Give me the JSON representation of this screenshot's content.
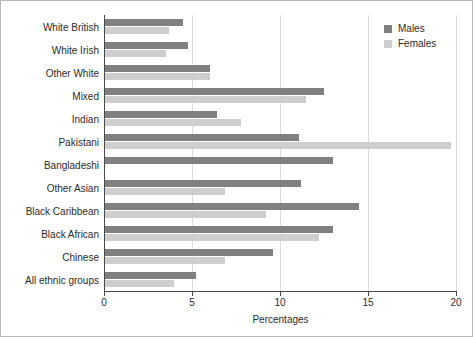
{
  "chart_data": {
    "type": "bar",
    "orientation": "horizontal",
    "title": "",
    "xlabel": "Percentages",
    "ylabel": "",
    "xlim": [
      0,
      20
    ],
    "xticks": [
      0,
      5,
      10,
      15,
      20
    ],
    "grid": "vertical",
    "legend_position": "top-right",
    "categories": [
      "White British",
      "White Irish",
      "Other White",
      "Mixed",
      "Indian",
      "Pakistani",
      "Bangladeshi",
      "Other Asian",
      "Black Caribbean",
      "Black African",
      "Chinese",
      "All ethnic groups"
    ],
    "series": [
      {
        "name": "Males",
        "color": "#808080",
        "values": [
          4.5,
          4.8,
          6.0,
          12.5,
          6.4,
          11.1,
          13.0,
          11.2,
          14.5,
          13.0,
          9.6,
          5.2
        ]
      },
      {
        "name": "Females",
        "color": "#cecece",
        "values": [
          3.7,
          3.5,
          6.0,
          11.5,
          7.8,
          19.7,
          0.0,
          6.9,
          9.2,
          12.2,
          6.9,
          4.0
        ]
      }
    ]
  },
  "legend": {
    "items": [
      {
        "label": "Males",
        "swatch": "males-swatch"
      },
      {
        "label": "Females",
        "swatch": "females-swatch"
      }
    ]
  },
  "axis": {
    "x_title": "Percentages",
    "x_tick_labels": [
      "0",
      "5",
      "10",
      "15",
      "20"
    ]
  }
}
